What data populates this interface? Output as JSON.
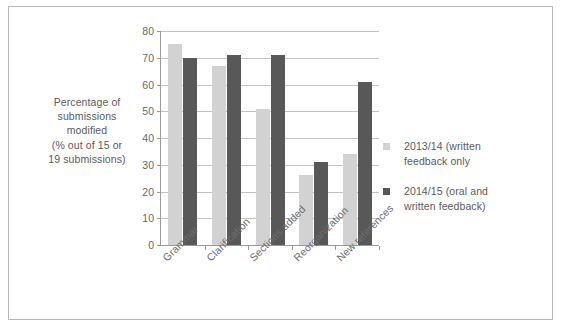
{
  "chart_data": {
    "type": "bar",
    "title": "",
    "subtitle": "",
    "xlabel": "",
    "ylabel": "Percentage of submissions modified (% out of 15 or 19 submissions)",
    "ylabel_lines": [
      "Percentage of",
      "submissions",
      "modified",
      "(% out of 15 or",
      "19 submissions)"
    ],
    "categories": [
      "Grammar",
      "Clarification",
      "Sections added",
      "Reorganization",
      "New references"
    ],
    "series": [
      {
        "name": "2013/14 (written feedback only",
        "name_lines": [
          "2013/14 (written",
          "feedback only"
        ],
        "color": "#d2d2d2",
        "values": [
          75,
          67,
          51,
          26,
          34
        ]
      },
      {
        "name": "2014/15 (oral and written feedback)",
        "name_lines": [
          "2014/15 (oral and",
          "written feedback)"
        ],
        "color": "#585858",
        "values": [
          70,
          71,
          71,
          31,
          61
        ]
      }
    ],
    "ylim": [
      0,
      80
    ],
    "yticks": [
      0,
      10,
      20,
      30,
      40,
      50,
      60,
      70,
      80
    ],
    "ytick_labels": [
      "0",
      "10",
      "20",
      "30",
      "40",
      "50",
      "60",
      "70",
      "80"
    ],
    "grid": true,
    "grid_axis": "y",
    "legend_position": "right",
    "border_color": "#b9b9b9",
    "axis_color": "#9a9a9a",
    "gridline_color": "#c3c3c3",
    "text_color": "#5b5b5b",
    "background": "#ffffff"
  }
}
